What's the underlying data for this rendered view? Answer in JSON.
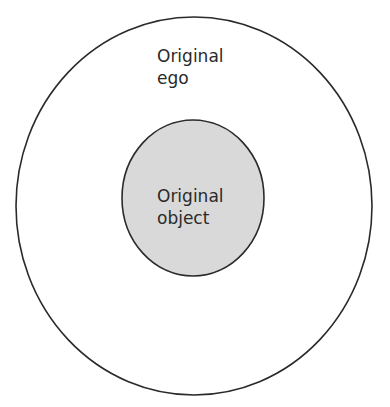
{
  "diagram": {
    "outer": {
      "label_line1": "Original",
      "label_line2": "ego",
      "fill": "#ffffff",
      "stroke": "#2a2a2a"
    },
    "inner": {
      "label_line1": "Original",
      "label_line2": "object",
      "fill": "#d9d9d9",
      "stroke": "#2a2a2a"
    }
  }
}
